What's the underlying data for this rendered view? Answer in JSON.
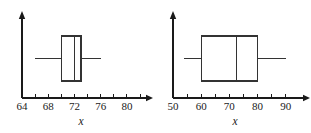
{
  "figure": {
    "background_color": "#ffffff",
    "line_color": "#333333",
    "axis_color": "#1a1a1a",
    "panel_count": 2
  },
  "chart_data": [
    {
      "type": "box",
      "panel": "left",
      "title": "",
      "xlabel": "x",
      "ylabel": "",
      "xlim": [
        64,
        82
      ],
      "grid": false,
      "legend": null,
      "axis": {
        "tick_step": 2,
        "label_step": 4,
        "ticks": [
          64,
          66,
          68,
          70,
          72,
          74,
          76,
          78,
          80,
          82
        ],
        "tick_labels": [
          "64",
          "",
          "68",
          "",
          "72",
          "",
          "76",
          "",
          "80",
          ""
        ],
        "labeled_ticks": [
          64,
          68,
          72,
          76,
          80
        ],
        "labeled_tick_text": [
          "64",
          "68",
          "72",
          "76",
          "80"
        ],
        "arrow_right": true,
        "vertical_axis_arrow": true
      },
      "box": {
        "whisker_min": 66,
        "q1": 70,
        "median": 72,
        "q3": 73,
        "whisker_max": 76
      }
    },
    {
      "type": "box",
      "panel": "right",
      "title": "",
      "xlabel": "x",
      "ylabel": "",
      "xlim": [
        50,
        94
      ],
      "grid": false,
      "legend": null,
      "axis": {
        "tick_step": 5,
        "label_step": 10,
        "ticks": [
          50,
          55,
          60,
          65,
          70,
          75,
          80,
          85,
          90
        ],
        "tick_labels": [
          "50",
          "",
          "60",
          "",
          "70",
          "",
          "80",
          "",
          "90"
        ],
        "labeled_ticks": [
          50,
          60,
          70,
          80,
          90
        ],
        "labeled_tick_text": [
          "50",
          "60",
          "70",
          "80",
          "90"
        ],
        "arrow_right": true,
        "vertical_axis_arrow": true
      },
      "box": {
        "whisker_min": 54,
        "q1": 60,
        "median": 72.5,
        "q3": 80,
        "whisker_max": 90
      }
    }
  ]
}
